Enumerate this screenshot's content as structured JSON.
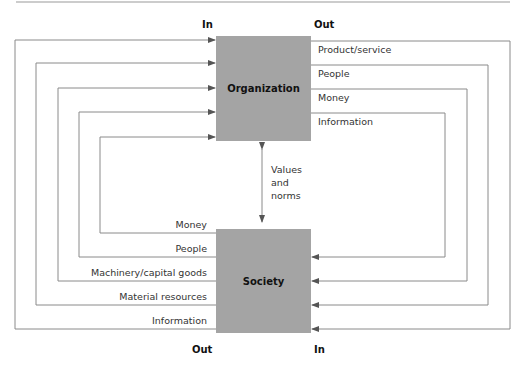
{
  "diagram": {
    "headers": {
      "top_in": "In",
      "top_out": "Out",
      "bottom_out": "Out",
      "bottom_in": "In"
    },
    "nodes": {
      "organization": "Organization",
      "society": "Society"
    },
    "organization_outputs": [
      "Product/service",
      "People",
      "Money",
      "Information"
    ],
    "society_outputs": [
      "Money",
      "People",
      "Machinery/capital goods",
      "Material resources",
      "Information"
    ],
    "link_label": [
      "Values",
      "and",
      "norms"
    ],
    "colors": {
      "box": "#a4a4a4",
      "line": "#8a8a8a"
    }
  }
}
